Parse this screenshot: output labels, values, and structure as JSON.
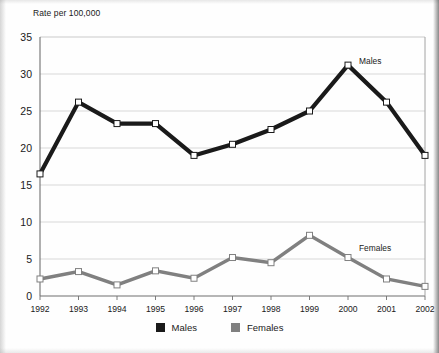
{
  "chart_data": {
    "type": "line",
    "title": "Rate per 100,000",
    "xlabel": "",
    "ylabel": "Rate per 100,000",
    "ylim": [
      0,
      35
    ],
    "ytick_step": 5,
    "yticks": [
      "0",
      "5",
      "10",
      "15",
      "20",
      "25",
      "30",
      "35"
    ],
    "grid": true,
    "legend_position": "bottom-center",
    "categories": [
      "1992",
      "1993",
      "1994",
      "1995",
      "1996",
      "1997",
      "1998",
      "1999",
      "2000",
      "2001",
      "2002"
    ],
    "series": [
      {
        "name": "Males",
        "color": "#1a1a1a",
        "annotation": "Males",
        "values": [
          16.5,
          26.2,
          23.3,
          23.3,
          19.0,
          20.5,
          22.5,
          25.0,
          31.2,
          26.2,
          19.0
        ]
      },
      {
        "name": "Females",
        "color": "#808080",
        "annotation": "Females",
        "values": [
          2.3,
          3.3,
          1.5,
          3.4,
          2.4,
          5.2,
          4.5,
          8.2,
          5.2,
          2.3,
          1.3
        ]
      }
    ]
  },
  "legend": {
    "items": [
      {
        "label": "Males",
        "color": "#1a1a1a"
      },
      {
        "label": "Females",
        "color": "#808080"
      }
    ]
  }
}
